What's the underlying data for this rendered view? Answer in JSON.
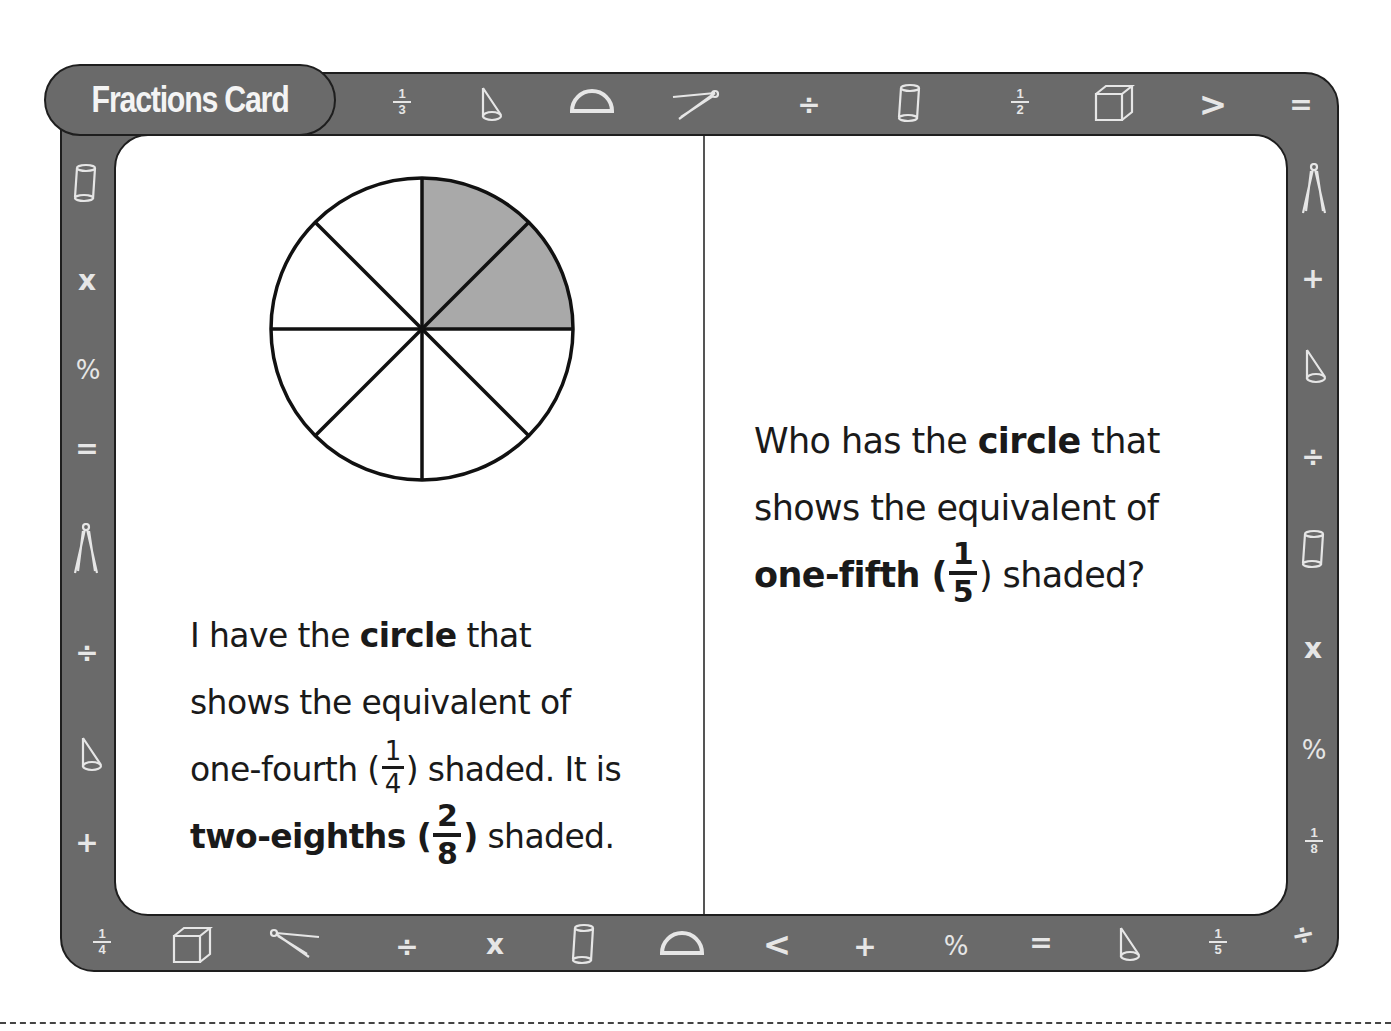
{
  "card": {
    "title": "Fractions Card",
    "frame_color": "#6a6a6a",
    "icon_color": "#e6e6e6"
  },
  "border_icons": {
    "top": [
      {
        "name": "fraction-one-third-icon",
        "num": "1",
        "den": "3"
      },
      {
        "name": "cone-icon"
      },
      {
        "name": "protractor-icon"
      },
      {
        "name": "compass-icon"
      },
      {
        "name": "divide-icon",
        "glyph": "÷"
      },
      {
        "name": "cylinder-icon"
      },
      {
        "name": "fraction-one-half-icon",
        "num": "1",
        "den": "2"
      },
      {
        "name": "cube-icon"
      },
      {
        "name": "greater-than-icon",
        "glyph": ">"
      },
      {
        "name": "equals-icon",
        "glyph": "="
      }
    ],
    "left": [
      {
        "name": "cylinder-icon"
      },
      {
        "name": "multiply-icon",
        "glyph": "x"
      },
      {
        "name": "percent-icon",
        "glyph": "%"
      },
      {
        "name": "equals-icon",
        "glyph": "="
      },
      {
        "name": "compass-icon"
      },
      {
        "name": "divide-icon",
        "glyph": "÷"
      },
      {
        "name": "cone-icon"
      },
      {
        "name": "plus-icon",
        "glyph": "+"
      }
    ],
    "right": [
      {
        "name": "compass-icon"
      },
      {
        "name": "plus-icon",
        "glyph": "+"
      },
      {
        "name": "cone-icon"
      },
      {
        "name": "divide-icon",
        "glyph": "÷"
      },
      {
        "name": "cylinder-icon"
      },
      {
        "name": "multiply-icon",
        "glyph": "x"
      },
      {
        "name": "percent-icon",
        "glyph": "%"
      },
      {
        "name": "fraction-one-eighth-icon",
        "num": "1",
        "den": "8"
      }
    ],
    "bottom": [
      {
        "name": "fraction-one-fourth-icon",
        "num": "1",
        "den": "4"
      },
      {
        "name": "cube-icon"
      },
      {
        "name": "compass-icon"
      },
      {
        "name": "divide-icon",
        "glyph": "÷"
      },
      {
        "name": "multiply-icon",
        "glyph": "x"
      },
      {
        "name": "cylinder-icon"
      },
      {
        "name": "protractor-icon"
      },
      {
        "name": "less-than-icon",
        "glyph": "<"
      },
      {
        "name": "plus-icon",
        "glyph": "+"
      },
      {
        "name": "percent-icon",
        "glyph": "%"
      },
      {
        "name": "equals-icon",
        "glyph": "="
      },
      {
        "name": "cone-icon"
      },
      {
        "name": "fraction-one-fifth-icon",
        "num": "1",
        "den": "5"
      },
      {
        "name": "divide-icon",
        "glyph": "÷"
      }
    ]
  },
  "left_panel": {
    "circle": {
      "total_slices": 8,
      "shaded_slices": 2,
      "shade_color": "#a9a9a9"
    },
    "statement": {
      "line1_a": "I have the ",
      "line1_b": "circle",
      "line1_c": " that",
      "line2": "shows the equivalent of",
      "line3_a": "one-fourth (",
      "line3_num": "1",
      "line3_den": "4",
      "line3_b": ") shaded. It is",
      "line4_a": "two-eighths (",
      "line4_num": "2",
      "line4_den": "8",
      "line4_b": ") shaded."
    }
  },
  "right_panel": {
    "question": {
      "line1_a": "Who has the ",
      "line1_b": "circle",
      "line1_c": " that",
      "line2": "shows the equivalent of",
      "line3_a": "one-fifth (",
      "line3_num": "1",
      "line3_den": "5",
      "line3_b": ") shaded?"
    }
  }
}
